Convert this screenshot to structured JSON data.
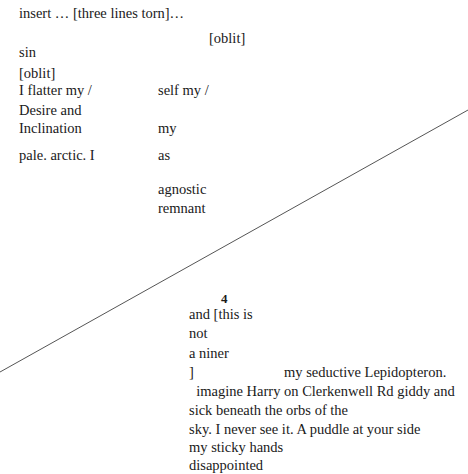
{
  "document": {
    "top": {
      "insert_line": "insert … [three lines torn]…",
      "oblit_1": "[oblit]",
      "sin": "sin",
      "oblit_2": "[oblit]"
    },
    "left_column": [
      "I flatter my /",
      "Desire and",
      "Inclination",
      "pale. arctic. I"
    ],
    "right_column": [
      "self my /",
      "my",
      "as",
      "agnostic",
      "remnant"
    ],
    "page_number": "4",
    "lower_block": {
      "lines": [
        "and [this is",
        "not",
        "a niner",
        "]"
      ],
      "lepidopteron": "my seductive Lepidopteron.",
      "paragraph": [
        "  imagine Harry on Clerkenwell Rd giddy and",
        "sick beneath the orbs of the",
        "sky. I never see it. A puddle at your side",
        "my sticky hands",
        "disappointed"
      ]
    },
    "diagonal_line": {
      "x1": 0,
      "y1": 372,
      "x2": 468,
      "y2": 110,
      "color": "#555555"
    }
  }
}
